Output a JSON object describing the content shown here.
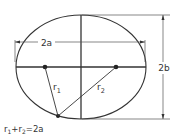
{
  "diagram": {
    "type": "ellipse-geometry",
    "labels": {
      "major_axis": "2a",
      "minor_axis": "2b",
      "r1": "r",
      "r1_sub": "1",
      "r2": "r",
      "r2_sub": "2",
      "equation_r1": "r",
      "equation_r1_sub": "1",
      "equation_plus": "+",
      "equation_r2": "r",
      "equation_r2_sub": "2",
      "equation_rhs": "=2a"
    },
    "colors": {
      "stroke": "#333333",
      "thin_stroke": "#555555",
      "focus": "#222222"
    }
  }
}
